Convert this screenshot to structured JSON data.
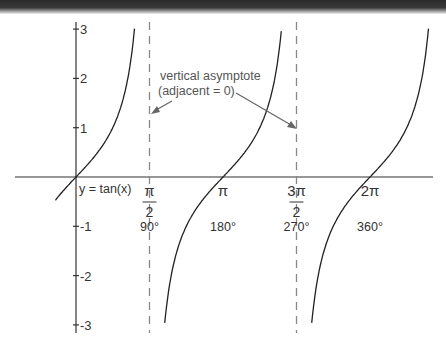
{
  "chart_data": {
    "type": "line",
    "title": "",
    "function_label": "y = tan(x)",
    "xlabel": "",
    "ylabel": "",
    "ylim": [
      -3,
      3
    ],
    "xlim_radians": [
      -0.5,
      7.0
    ],
    "y_ticks": [
      "3",
      "2",
      "1",
      "-1",
      "-2",
      "-3"
    ],
    "y_tick_values": [
      3,
      2,
      1,
      -1,
      -2,
      -3
    ],
    "x_ticks": [
      {
        "radian_label": "π/2",
        "num": "π",
        "den": "2",
        "degree_label": "90°",
        "value": 1.5708,
        "asymptote": true
      },
      {
        "radian_label": "π",
        "num": "π",
        "den": "",
        "degree_label": "180°",
        "value": 3.1416,
        "asymptote": false
      },
      {
        "radian_label": "3π/2",
        "num": "3π",
        "den": "2",
        "degree_label": "270°",
        "value": 4.7124,
        "asymptote": true
      },
      {
        "radian_label": "2π",
        "num": "2π",
        "den": "",
        "degree_label": "360°",
        "value": 6.2832,
        "asymptote": false
      }
    ],
    "annotation": {
      "line1": "vertical asymptote",
      "line2": "(adjacent = 0)"
    },
    "series": [
      {
        "name": "tan(x)",
        "x": [
          -0.5,
          -0.25,
          0,
          0.25,
          0.5,
          0.75,
          1.0,
          1.25
        ],
        "y": [
          -0.55,
          -0.26,
          0,
          0.26,
          0.55,
          0.93,
          1.56,
          3.0
        ]
      }
    ],
    "grid": false,
    "legend": "none"
  }
}
